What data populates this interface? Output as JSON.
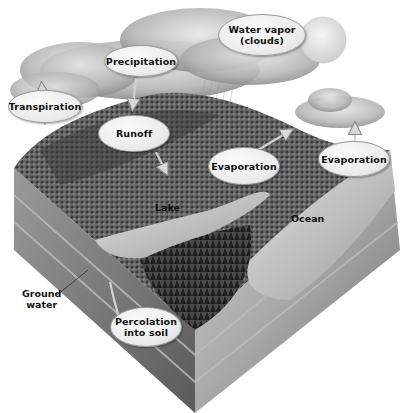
{
  "diagram": {
    "type": "water-cycle-illustration",
    "colors": {
      "label_fill": "#ececec",
      "label_border": "#9a9a9a",
      "text": "#111111",
      "background": "#ffffff"
    },
    "labels": {
      "water_vapor": "Water vapor (clouds)",
      "water_vapor_line1": "Water vapor",
      "water_vapor_line2": "(clouds)",
      "precipitation": "Precipitation",
      "transpiration": "Transpiration",
      "runoff": "Runoff",
      "evaporation_lake": "Evaporation",
      "evaporation_ocean": "Evaporation",
      "lake": "Lake",
      "ocean": "Ocean",
      "ground_water_line1": "Ground",
      "ground_water_line2": "water",
      "percolation_line1": "Percolation",
      "percolation_line2": "into soil"
    }
  }
}
